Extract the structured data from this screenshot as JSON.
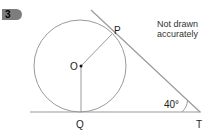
{
  "question": {
    "number": "3"
  },
  "note": {
    "line1": "Not drawn",
    "line2": "accurately"
  },
  "points": {
    "P": "P",
    "O": "O",
    "Q": "Q",
    "T": "T"
  },
  "angle": {
    "label": "40°",
    "at": "T"
  },
  "colors": {
    "line": "#9a9a9a",
    "badge": "#7d7d7d",
    "text": "#222222"
  }
}
